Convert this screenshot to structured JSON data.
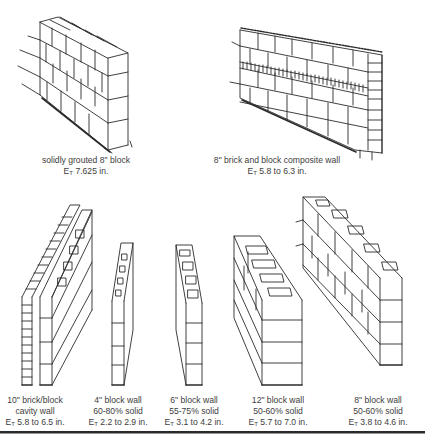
{
  "diagram": {
    "type": "masonry wall thickness illustrations",
    "symbol": {
      "E": "E",
      "sub": "T"
    }
  },
  "walls": [
    {
      "id": "solid-grouted-8-block",
      "lines": [
        "solidly grouted 8\" block"
      ],
      "et": "7.625 in."
    },
    {
      "id": "brick-block-composite-8",
      "lines": [
        "8\" brick and block composite wall"
      ],
      "et": "5.8 to 6.3 in."
    },
    {
      "id": "brick-block-cavity-10",
      "lines": [
        "10\" brick/block",
        "cavity wall"
      ],
      "et": "5.8 to 6.5 in."
    },
    {
      "id": "block-wall-4",
      "lines": [
        "4\" block wall",
        "60-80% solid"
      ],
      "et": "2.2 to 2.9 in."
    },
    {
      "id": "block-wall-6",
      "lines": [
        "6\" block wall",
        "55-75% solid"
      ],
      "et": "3.1 to 4.2 in."
    },
    {
      "id": "block-wall-12",
      "lines": [
        "12\" block wall",
        "50-60% solid"
      ],
      "et": "5.7 to 7.0 in."
    },
    {
      "id": "block-wall-8",
      "lines": [
        "8\" block wall",
        "50-60% solid"
      ],
      "et": "3.8 to 4.6 in."
    }
  ]
}
